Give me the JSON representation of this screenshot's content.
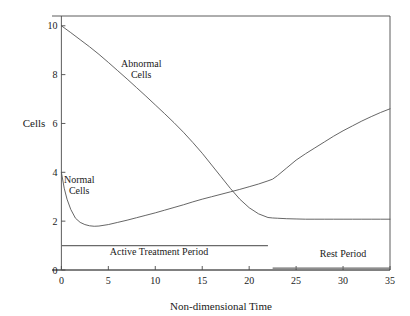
{
  "chart_data": {
    "type": "line",
    "title": "",
    "xlabel": "Non-dimensional Time",
    "ylabel": "Cells",
    "xlim": [
      -1,
      35
    ],
    "ylim": [
      0,
      10.4
    ],
    "xticks": [
      0,
      5,
      10,
      15,
      20,
      25,
      30,
      35
    ],
    "xtick_labels": [
      "0",
      "5",
      "10",
      "15",
      "20",
      "25",
      "30",
      "35"
    ],
    "yticks": [
      0,
      2,
      4,
      6,
      8,
      10
    ],
    "ytick_labels": [
      "0",
      "2",
      "4",
      "6",
      "8",
      "10"
    ],
    "grid": false,
    "legend_position": "inline-annotations",
    "series": [
      {
        "name": "Abnormal Cells",
        "label_position": {
          "x": 8.5,
          "y": 8.3
        },
        "x": [
          0,
          1,
          2,
          3,
          4,
          5,
          6,
          7,
          8,
          9,
          10,
          11,
          12,
          13,
          14,
          15,
          16,
          17,
          18,
          19,
          20,
          21,
          22,
          22.5,
          23,
          24,
          25,
          26,
          27,
          28,
          29,
          30,
          31,
          32,
          33,
          34,
          35
        ],
        "y": [
          10.0,
          9.72,
          9.43,
          9.14,
          8.83,
          8.5,
          8.16,
          7.82,
          7.47,
          7.12,
          6.76,
          6.4,
          6.03,
          5.64,
          5.22,
          4.78,
          4.3,
          3.82,
          3.34,
          2.9,
          2.55,
          2.3,
          2.15,
          2.13,
          2.12,
          2.1,
          2.09,
          2.08,
          2.08,
          2.08,
          2.08,
          2.08,
          2.08,
          2.08,
          2.08,
          2.08,
          2.08
        ]
      },
      {
        "name": "Normal Cells",
        "label_position": {
          "x": 1.9,
          "y": 3.55
        },
        "x": [
          0,
          0.3,
          0.6,
          1,
          1.5,
          2,
          2.5,
          3,
          3.5,
          4,
          5,
          6,
          7,
          8,
          9,
          10,
          11,
          12,
          13,
          14,
          15,
          16,
          17,
          18,
          19,
          20,
          21,
          22,
          22.5,
          23,
          24,
          25,
          26,
          27,
          28,
          29,
          30,
          31,
          32,
          33,
          34,
          35
        ],
        "y": [
          4.0,
          3.35,
          2.9,
          2.48,
          2.12,
          1.95,
          1.86,
          1.81,
          1.79,
          1.8,
          1.86,
          1.95,
          2.04,
          2.14,
          2.24,
          2.34,
          2.45,
          2.56,
          2.67,
          2.79,
          2.9,
          3.0,
          3.1,
          3.2,
          3.3,
          3.41,
          3.52,
          3.65,
          3.72,
          3.86,
          4.18,
          4.5,
          4.76,
          5.0,
          5.24,
          5.48,
          5.7,
          5.9,
          6.1,
          6.28,
          6.45,
          6.6
        ]
      }
    ],
    "annotations": [
      {
        "name": "abnormal-cells-label",
        "text_lines": [
          "Abnormal",
          "Cells"
        ],
        "x": 8.5,
        "y": 8.3
      },
      {
        "name": "normal-cells-label",
        "text_lines": [
          "Normal",
          "Cells"
        ],
        "x": 1.9,
        "y": 3.55
      },
      {
        "name": "active-treatment-period",
        "text": "Active Treatment Period",
        "bar_x_start": 0,
        "bar_x_end": 22,
        "bar_y": 1.0,
        "label_x": 10.4,
        "label_y": 0.62
      },
      {
        "name": "rest-period",
        "text": "Rest Period",
        "bar_x_start": 22.5,
        "bar_x_end": 35,
        "bar_y": 0.08,
        "label_x": 30.0,
        "label_y": 0.52
      }
    ],
    "colors": {
      "line": "#555555",
      "frame": "#4a4a4a",
      "text": "#1a1a1a",
      "period_bar": "#6a6a6a",
      "background": "#ffffff"
    }
  }
}
